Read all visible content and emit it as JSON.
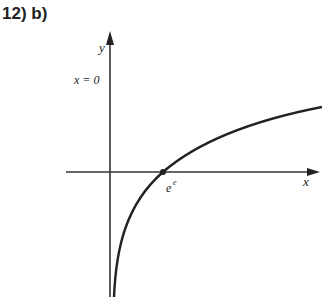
{
  "title": "12) b)",
  "diagram": {
    "y_axis_label": "y",
    "x_axis_label": "x",
    "asymptote_label": "x = 0",
    "intercept_label": "e",
    "intercept_superscript": "e",
    "curve": "logarithmic, vertical asymptote x=0, crosses x-axis at e^e"
  }
}
